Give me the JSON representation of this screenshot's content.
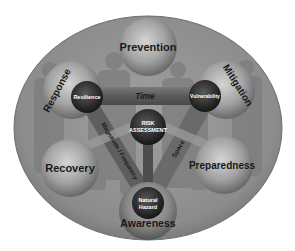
{
  "diagram": {
    "type": "concept-diagram",
    "colors": {
      "background": "#ffffff",
      "ellipse": "#8a8a8a",
      "ellipse_edge": "#6e6e6e",
      "silhouettes": "#7a7a7a",
      "sphere_light": "#c8c8c8",
      "sphere_dark": "#6a6a6a",
      "inner_sphere_light": "#5a5a5a",
      "inner_sphere_dark": "#1e1e1e",
      "beam": "#5e5e5e",
      "beam_light": "#9a9a9a",
      "outer_text": "#1a1a1a",
      "inner_text": "#ffffff"
    },
    "outer_spheres": [
      {
        "id": "prevention",
        "label": "Prevention"
      },
      {
        "id": "response",
        "label": "Response"
      },
      {
        "id": "mitigation",
        "label": "Mitigation"
      },
      {
        "id": "recovery",
        "label": "Recovery"
      },
      {
        "id": "preparedness",
        "label": "Preparedness"
      },
      {
        "id": "awareness",
        "label": "Awareness"
      }
    ],
    "inner_nodes": [
      {
        "id": "resilience",
        "label": "Resilience"
      },
      {
        "id": "vulnerability",
        "label": "Vulnerability"
      },
      {
        "id": "risk_assessment",
        "line1": "RISK",
        "line2": "ASSESSMENT"
      },
      {
        "id": "natural_hazard",
        "line1": "Natural",
        "line2": "Hazard"
      }
    ],
    "connectors": [
      {
        "id": "time",
        "label": "Time",
        "from": "Resilience",
        "to": "Vulnerability"
      },
      {
        "id": "magnitude_frequency",
        "label": "Magnitude / Frequency",
        "from": "Resilience",
        "to": "Natural Hazard"
      },
      {
        "id": "space",
        "label": "Space",
        "from": "Vulnerability",
        "to": "Natural Hazard"
      }
    ]
  }
}
